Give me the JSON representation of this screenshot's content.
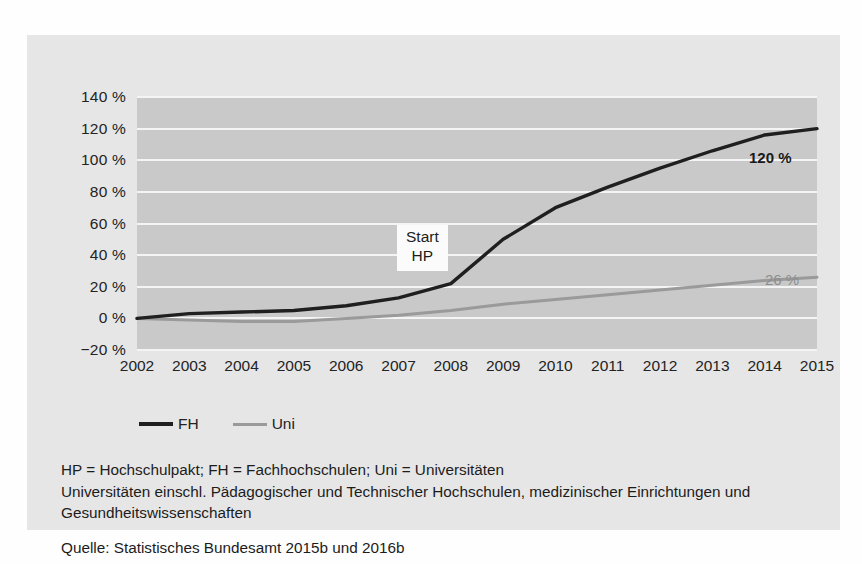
{
  "chart_data": {
    "type": "line",
    "title": "",
    "xlabel": "",
    "ylabel": "",
    "x": [
      2002,
      2003,
      2004,
      2005,
      2006,
      2007,
      2008,
      2009,
      2010,
      2011,
      2012,
      2013,
      2014,
      2015
    ],
    "xticklabels": [
      "2002",
      "2003",
      "2004",
      "2005",
      "2006",
      "2007",
      "2008",
      "2009",
      "2010",
      "2011",
      "2012",
      "2013",
      "2014",
      "2015"
    ],
    "yticklabels": [
      "140 %",
      "120 %",
      "100 %",
      "80 %",
      "60 %",
      "40 %",
      "20 %",
      "0 %",
      "−20 %"
    ],
    "yticks": [
      140,
      120,
      100,
      80,
      60,
      40,
      20,
      0,
      -20
    ],
    "ylim": [
      -20,
      140
    ],
    "grid": true,
    "legend_position": "below-left",
    "series": [
      {
        "name": "FH",
        "color": "#1f1f1f",
        "values": [
          0,
          3,
          4,
          5,
          8,
          13,
          22,
          50,
          70,
          83,
          95,
          106,
          116,
          120
        ],
        "end_label": "120 %"
      },
      {
        "name": "Uni",
        "color": "#9a9a9a",
        "values": [
          0,
          -1,
          -2,
          -2,
          0,
          2,
          5,
          9,
          12,
          15,
          18,
          21,
          24,
          26
        ],
        "end_label": "26 %"
      }
    ],
    "annotations": [
      {
        "text_line1": "Start",
        "text_line2": "HP",
        "at_x": 2008
      }
    ]
  },
  "legend": {
    "items": [
      {
        "label": "FH"
      },
      {
        "label": "Uni"
      }
    ]
  },
  "annotation": {
    "line1": "Start",
    "line2": "HP"
  },
  "labels": {
    "fh_value": "120 %",
    "uni_value": "26 %"
  },
  "notes": {
    "abbreviations": "HP = Hochschulpakt; FH = Fachhochschulen; Uni = Universitäten",
    "definition": "Universitäten einschl. Pädagogischer und  Technischer Hochschulen, medizinischer Einrichtungen und Gesundheitswissenschaften",
    "source": "Quelle: Statistisches Bundesamt 2015b  und 2016b"
  },
  "colors": {
    "page_background": "#fefefe",
    "panel_background": "#e6e6e6",
    "plot_background": "#c9c9c9",
    "gridline": "#f4f4f4",
    "series_fh": "#1f1f1f",
    "series_uni": "#9a9a9a",
    "text": "#1c1c1c"
  }
}
